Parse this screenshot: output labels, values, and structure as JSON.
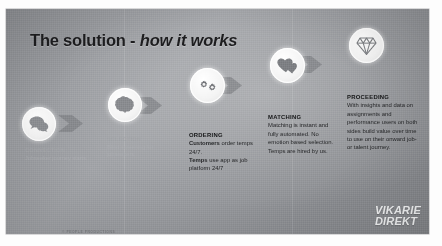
{
  "slide": {
    "title_main": "The solution -",
    "title_emphasis": "how it works",
    "footnote": "© PEOPLE PRODUCTIONS",
    "logo_line1": "VIKARIE",
    "logo_line2": "DIREKT",
    "background_color": "#9a9ca0",
    "title_color": "#1d1d1f",
    "logo_color": "#f2f3f4"
  },
  "steps": [
    {
      "id": "connection",
      "icon": "speech-bubbles-icon",
      "heading": "CONNECTION",
      "body": "Jobseeker journey starts."
    },
    {
      "id": "selection",
      "icon": "brain-icon",
      "heading": "SELECTION",
      "body": "Blind screening for jobseekers"
    },
    {
      "id": "ordering",
      "icon": "gears-icon",
      "heading": "ORDERING",
      "body_line1_strong": "Customers",
      "body_line1_rest": " order temps 24/7.",
      "body_line2_strong": "Temps",
      "body_line2_rest": " use app as job platform 24/7"
    },
    {
      "id": "matching",
      "icon": "hearts-icon",
      "heading": "MATCHING",
      "body": "Matching is instant and fully automated. No emotion based selection. Temps are hired by us."
    },
    {
      "id": "proceeding",
      "icon": "diamond-icon",
      "heading": "PROCEEDING",
      "body": "With  insights and data on assignments and performance users on both sides build value over time to use on their onward job- or talent journey."
    }
  ],
  "arrows": [
    {
      "id": "arrow-1",
      "from": "connection",
      "to": "selection"
    },
    {
      "id": "arrow-2",
      "from": "selection",
      "to": "ordering"
    },
    {
      "id": "arrow-3",
      "from": "ordering",
      "to": "matching"
    },
    {
      "id": "arrow-4",
      "from": "matching",
      "to": "proceeding"
    }
  ]
}
